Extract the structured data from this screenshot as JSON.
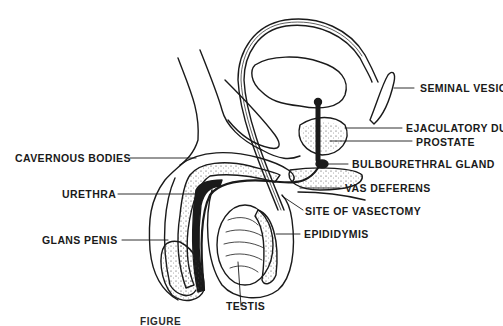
{
  "figure": {
    "caption_visible_prefix": "FIGURE",
    "labels": {
      "seminal_vesicle": "SEMINAL VESICLE",
      "ejaculatory_duct": "EJACULATORY DUCT",
      "prostate": "PROSTATE",
      "bulbourethral_gland": "BULBOURETHRAL GLAND",
      "vas_deferens": "VAS DEFERENS",
      "site_of_vasectomy": "SITE OF VASECTOMY",
      "epididymis": "EPIDIDYMIS",
      "testis": "TESTIS",
      "cavernous_bodies": "CAVERNOUS BODIES",
      "urethra": "URETHRA",
      "glans_penis": "GLANS PENIS"
    },
    "colors": {
      "ink": "#1a1a1a",
      "background": "#ffffff"
    }
  }
}
